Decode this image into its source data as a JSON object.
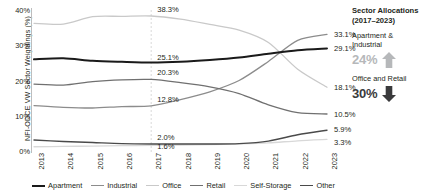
{
  "chart_data": {
    "type": "line",
    "title": "",
    "xlabel": "",
    "ylabel": "NFI-ODCE VW Sector Weightings (%)",
    "ylim": [
      0,
      40
    ],
    "yticks": [
      "0%",
      "10%",
      "20%",
      "30%",
      "40%"
    ],
    "ytick_values": [
      0,
      10,
      20,
      30,
      40
    ],
    "grid": false,
    "legend_position": "bottom",
    "x": [
      2013,
      2014,
      2015,
      2016,
      2017,
      2018,
      2019,
      2020,
      2021,
      2022,
      2023
    ],
    "categories": [
      "2013",
      "2014",
      "2015",
      "2016",
      "2017",
      "2018",
      "2019",
      "2020",
      "2021",
      "2022",
      "2023"
    ],
    "series": [
      {
        "name": "Apartment",
        "color": "#1a1a1a",
        "width": 2.0,
        "values": [
          26.0,
          26.3,
          25.6,
          25.3,
          25.1,
          25.3,
          25.8,
          26.5,
          27.6,
          28.6,
          29.1
        ],
        "label_2017": "25.1%",
        "label_end": "29.1%"
      },
      {
        "name": "Industrial",
        "color": "#8c8c8c",
        "width": 1.3,
        "values": [
          12.9,
          12.4,
          12.2,
          12.6,
          12.8,
          14.6,
          16.8,
          20.0,
          25.4,
          31.4,
          33.1
        ],
        "label_2017": "12.8%",
        "label_end": "33.1%"
      },
      {
        "name": "Office",
        "color": "#c9c9c9",
        "width": 1.3,
        "values": [
          36.2,
          36.0,
          38.1,
          38.2,
          38.3,
          37.4,
          35.9,
          34.3,
          30.8,
          23.2,
          18.1
        ],
        "label_2017": "38.3%",
        "label_end": "18.1%"
      },
      {
        "name": "Retail",
        "color": "#707070",
        "width": 1.3,
        "values": [
          19.0,
          18.7,
          19.7,
          20.2,
          20.3,
          19.4,
          18.2,
          16.3,
          13.1,
          10.9,
          10.5
        ],
        "label_2017": "20.3%",
        "label_end": "10.5%"
      },
      {
        "name": "Self-Storage",
        "color": "#d8d8d8",
        "width": 1.3,
        "values": [
          1.2,
          1.3,
          1.4,
          1.5,
          1.6,
          1.7,
          1.8,
          2.0,
          2.3,
          2.9,
          3.3
        ],
        "label_2017": "1.6%",
        "label_end": "3.3%"
      },
      {
        "name": "Other",
        "color": "#4a4a4a",
        "width": 1.4,
        "values": [
          3.1,
          2.7,
          2.4,
          2.1,
          2.0,
          2.0,
          2.0,
          2.1,
          2.8,
          4.6,
          5.9
        ],
        "label_2017": "2.0%",
        "label_end": "5.9%"
      }
    ],
    "annotation_year": 2017,
    "annotation_line_color": "#d9d9d9"
  },
  "panel": {
    "title_line1": "Sector Allocations",
    "title_line2": "(2017–2023)",
    "groups": [
      {
        "name_line1": "Apartment &",
        "name_line2": "Industrial",
        "value": "24%",
        "direction": "up",
        "arrow_icon": "arrow-up-icon",
        "color": "#b6b8ba"
      },
      {
        "name_line1": "Office and Retail",
        "name_line2": "",
        "value": "30%",
        "direction": "down",
        "arrow_icon": "arrow-down-icon",
        "color": "#3a3a3c"
      }
    ]
  }
}
